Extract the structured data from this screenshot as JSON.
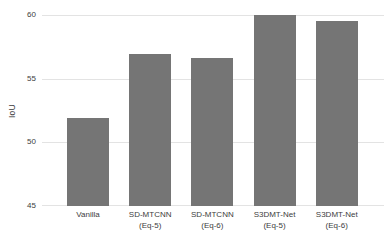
{
  "chart_data": {
    "type": "bar",
    "categories": [
      "Vanilla",
      "SD-MTCNN\n(Eq-5)",
      "SD-MTCNN\n(Eq-6)",
      "S3DMT-Net\n(Eq-5)",
      "S3DMT-Net\n(Eq-6)"
    ],
    "values": [
      51.9,
      56.9,
      56.6,
      60.0,
      59.5
    ],
    "title": "",
    "xlabel": "",
    "ylabel": "IoU",
    "ylim": [
      45,
      60
    ],
    "yticks": [
      45,
      50,
      55,
      60
    ],
    "xlim": [
      -0.74,
      4.76
    ],
    "grid": true,
    "legend": false,
    "bar_color": "#757575",
    "gridline_color": "#e3e3e3",
    "text_color": "#3d3d3d",
    "background": "#ffffff"
  },
  "layout": {
    "bar_width_px": 42,
    "plot_left_px": 42,
    "plot_top_px": 15,
    "plot_width_px": 342,
    "plot_height_px": 191
  }
}
